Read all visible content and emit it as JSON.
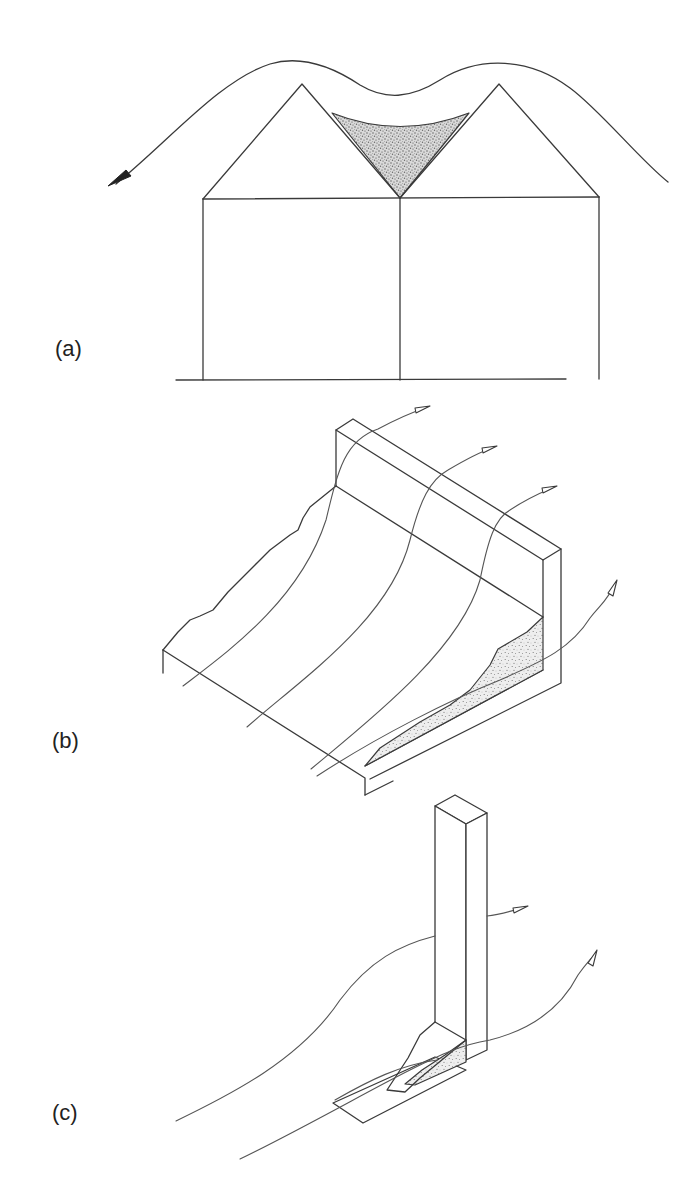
{
  "figure": {
    "panels": [
      {
        "id": "a",
        "label": "(a)",
        "description": "Side elevation of two adjacent gable roofs with a wind streamline passing over both ridges; snow drift (stippled) accumulates in the valley between the roofs",
        "elements": [
          "wind-streamline",
          "solid-arrowhead",
          "gable-roof-left",
          "gable-roof-right",
          "valley-drift",
          "ground-line"
        ]
      },
      {
        "id": "b",
        "label": "(b)",
        "description": "Isometric view of a sloped surface meeting a vertical parapet wall; three streamlines flow over the wall and one flows along the corner; snow drift (stippled) builds in the corner against the wall",
        "elements": [
          "sloped-surface",
          "parapet-wall",
          "streamlines-x4",
          "open-arrowheads",
          "corner-drift"
        ]
      },
      {
        "id": "c",
        "label": "(c)",
        "description": "Isometric view of a tall rectangular post on a base plate; streamlines pass around the post with a small snow drift (stippled) forming at its base",
        "elements": [
          "vertical-post",
          "base-plate",
          "streamlines-x2",
          "open-arrowheads",
          "base-drift"
        ]
      }
    ],
    "colors": {
      "line": "#3a3a3a",
      "background": "#ffffff",
      "stipple": "#6a6a6a",
      "label": "#222222"
    }
  }
}
